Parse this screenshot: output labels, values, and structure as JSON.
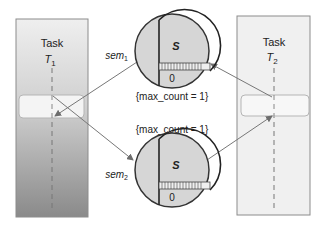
{
  "diagram": {
    "type": "semaphore-deadlock",
    "tasks": [
      {
        "id": "T1",
        "label": "Task",
        "name": "T",
        "subscript": "1",
        "fill_top": "#ececec",
        "fill_bottom": "#8a8a8a"
      },
      {
        "id": "T2",
        "label": "Task",
        "name": "T",
        "subscript": "2",
        "fill_top": "#f0f0f0",
        "fill_bottom": "#f0f0f0"
      }
    ],
    "semaphores": [
      {
        "id": "sem1",
        "label": "sem",
        "subscript": "1",
        "s_label": "S",
        "count_label": "0",
        "max_count_text": "{max_count = 1}"
      },
      {
        "id": "sem2",
        "label": "sem",
        "subscript": "2",
        "s_label": "S",
        "count_label": "0",
        "max_count_text": "{max_count = 1}"
      }
    ],
    "edges": [
      {
        "from": "T1",
        "to": "sem1",
        "desc": "T1 critical region to sem1"
      },
      {
        "from": "sem1",
        "to": "T1",
        "desc": "arrow into T1 critical region"
      },
      {
        "from": "T1",
        "to": "sem2",
        "desc": "T1 to sem2 arrow"
      },
      {
        "from": "sem1",
        "to": "T2",
        "desc": "T2 to sem1 arrow"
      },
      {
        "from": "sem2",
        "to": "T2",
        "desc": "sem2 to T2 arrow"
      }
    ],
    "colors": {
      "circle_fill": "#d6d6d6",
      "outline": "#333333",
      "arrow": "#777777",
      "critical_box": "#f4f4f4"
    }
  }
}
